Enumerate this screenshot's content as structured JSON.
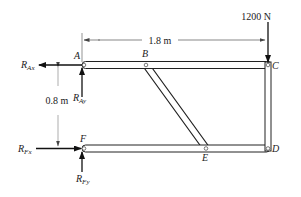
{
  "diagram": {
    "type": "frame free-body diagram",
    "points": {
      "A": "A",
      "B": "B",
      "C": "C",
      "D": "D",
      "E": "E",
      "F": "F"
    },
    "reactions": {
      "R_Ax": {
        "base": "R",
        "sub": "Ax"
      },
      "R_Ay": {
        "base": "R",
        "sub": "Ay"
      },
      "R_Fx": {
        "base": "R",
        "sub": "Fx"
      },
      "R_Fy": {
        "base": "R",
        "sub": "Fy"
      }
    },
    "load": {
      "label": "1200 N",
      "point": "C",
      "direction": "down"
    },
    "dimensions": {
      "horizontal": "1.8 m",
      "vertical": "0.8 m"
    },
    "members": [
      "AC",
      "CD",
      "FD",
      "BE"
    ],
    "colors": {
      "line": "#222222",
      "dim": "#555555",
      "member_fill": "#ffffff"
    }
  }
}
